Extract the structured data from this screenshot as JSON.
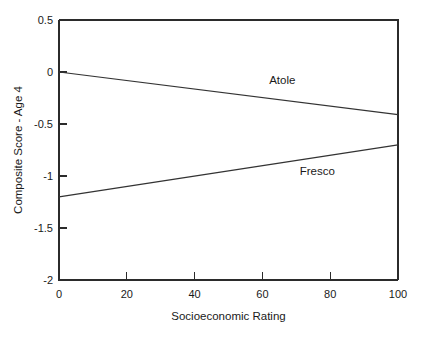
{
  "chart_data": {
    "type": "line",
    "title": "",
    "xlabel": "Socioeconomic Rating",
    "ylabel": "Composite Score - Age 4",
    "xlim": [
      0,
      100
    ],
    "ylim": [
      -2,
      0.5
    ],
    "xticks": [
      0,
      20,
      40,
      60,
      80,
      100
    ],
    "xtick_labels": [
      "0",
      "20",
      "40",
      "60",
      "80",
      "100"
    ],
    "yticks": [
      0.5,
      0,
      -0.5,
      -1,
      -1.5,
      -2
    ],
    "ytick_labels": [
      "0.5",
      "0",
      "-0.5",
      "-1",
      "-1.5",
      "-2"
    ],
    "grid": false,
    "legend_position": "inline-annotations",
    "x": [
      0,
      100
    ],
    "series": [
      {
        "name": "Atole",
        "values": [
          0.0,
          -0.41
        ],
        "label_text": "Atole",
        "label_x": 62,
        "label_y": -0.12,
        "color": "#333333"
      },
      {
        "name": "Fresco",
        "values": [
          -1.2,
          -0.7
        ],
        "label_text": "Fresco",
        "label_x": 71,
        "label_y": -0.99,
        "color": "#333333"
      }
    ],
    "annotations": [
      "Atole",
      "Fresco"
    ]
  },
  "figure": {
    "background_color": "#ffffff",
    "axis_color": "#2b2b2b",
    "line_color": "#333333"
  }
}
